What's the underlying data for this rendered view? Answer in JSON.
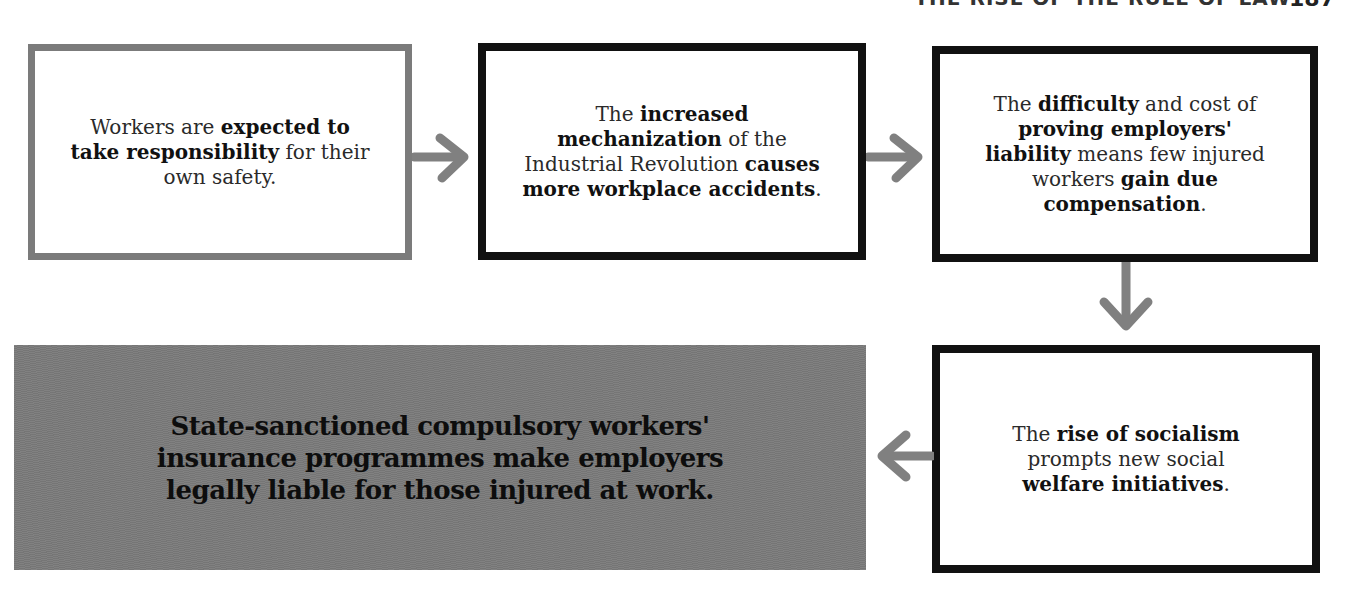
{
  "page_header": {
    "running_title": "THE RISE OF THE RULE OF LAW",
    "page_number": "187"
  },
  "flowchart": {
    "steps": [
      {
        "id": 1,
        "segments": [
          {
            "text": "Workers are ",
            "bold": false
          },
          {
            "text": "expected to take responsibility",
            "bold": true
          },
          {
            "text": " for their own safety.",
            "bold": false
          }
        ],
        "lines": [
          "Workers are expected to",
          "take responsibility for",
          "their own safety."
        ],
        "border": "grey"
      },
      {
        "id": 2,
        "segments": [
          {
            "text": "The ",
            "bold": false
          },
          {
            "text": "increased mechanization",
            "bold": true
          },
          {
            "text": " of the Industrial Revolution ",
            "bold": false
          },
          {
            "text": "causes more workplace accidents",
            "bold": true
          },
          {
            "text": ".",
            "bold": false
          }
        ],
        "border": "black"
      },
      {
        "id": 3,
        "segments": [
          {
            "text": "The ",
            "bold": false
          },
          {
            "text": "difficulty",
            "bold": true
          },
          {
            "text": " and cost of ",
            "bold": false
          },
          {
            "text": "proving employers' liability",
            "bold": true
          },
          {
            "text": " means few injured workers ",
            "bold": false
          },
          {
            "text": "gain due compensation",
            "bold": true
          },
          {
            "text": ".",
            "bold": false
          }
        ],
        "border": "black"
      },
      {
        "id": 4,
        "segments": [
          {
            "text": "The ",
            "bold": false
          },
          {
            "text": "rise of socialism",
            "bold": true
          },
          {
            "text": " prompts new social ",
            "bold": false
          },
          {
            "text": "welfare initiatives",
            "bold": true
          },
          {
            "text": ".",
            "bold": false
          }
        ],
        "border": "black"
      },
      {
        "id": 5,
        "text": "State-sanctioned compulsory workers' insurance programmes make employers legally liable for those injured at work.",
        "lines": [
          "State-sanctioned compulsory workers'",
          "insurance programmes make employers",
          "legally liable for those injured at work."
        ],
        "border": "none",
        "fill": "#7a7a7a"
      }
    ],
    "arrows": [
      {
        "from": 1,
        "to": 2,
        "direction": "right",
        "icon": "arrow-right-icon"
      },
      {
        "from": 2,
        "to": 3,
        "direction": "right",
        "icon": "arrow-right-icon"
      },
      {
        "from": 3,
        "to": 4,
        "direction": "down",
        "icon": "arrow-down-icon"
      },
      {
        "from": 4,
        "to": 5,
        "direction": "left",
        "icon": "arrow-left-icon"
      }
    ]
  },
  "text": {
    "s1a": "Workers are ",
    "s1b": "expected to take responsibility",
    "s1c": " for their own safety.",
    "s2a": "The ",
    "s2b": "increased mechanization",
    "s2c": " of the Industrial Revolution ",
    "s2d": "causes more workplace accidents",
    "s2e": ".",
    "s3a": "The ",
    "s3b": "difficulty",
    "s3c": " and cost of ",
    "s3d": "proving employers' liability",
    "s3e": " means few injured workers ",
    "s3f": "gain due compensation",
    "s3g": ".",
    "s4a": "The ",
    "s4b": "rise of socialism",
    "s4c": " prompts new social ",
    "s4d": "welfare initiatives",
    "s4e": ".",
    "s5l1": "State-sanctioned compulsory workers'",
    "s5l2": "insurance programmes make employers",
    "s5l3": "legally liable for those injured at work."
  },
  "colors": {
    "grey_border": "#7b7b7b",
    "black_border": "#111111",
    "arrow": "#808080",
    "conclusion_fill": "#7a7a7a"
  }
}
